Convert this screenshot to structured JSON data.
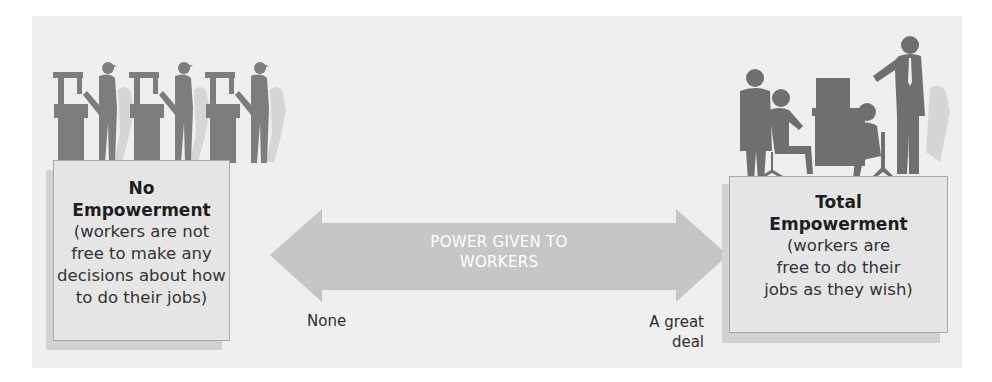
{
  "diagram": {
    "arrow": {
      "label_line1": "POWER GIVEN TO",
      "label_line2": "WORKERS",
      "left_end_label": "None",
      "right_end_label_line1": "A great",
      "right_end_label_line2": "deal"
    },
    "left_box": {
      "title_line1": "No",
      "title_line2": "Empowerment",
      "desc_line1": "(workers are not",
      "desc_line2": "free to make any",
      "desc_line3": "decisions about how",
      "desc_line4": "to do their jobs)",
      "illustration": "three-workers-at-machines-silhouette"
    },
    "right_box": {
      "title_line1": "Total",
      "title_line2": "Empowerment",
      "desc_line1": "(workers are",
      "desc_line2": "free to do their",
      "desc_line3": "jobs as they wish)",
      "illustration": "office-team-with-computer-silhouette"
    },
    "colors": {
      "panel_bg": "#efefef",
      "box_bg": "#e6e6e6",
      "arrow": "#c4c4c4",
      "silhouette": "#7a7a7a",
      "silhouette_shadow": "#d4d4d4"
    }
  }
}
